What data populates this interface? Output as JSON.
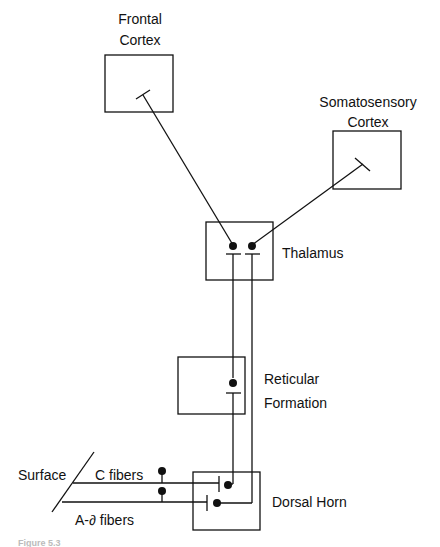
{
  "diagram": {
    "colors": {
      "ink": "#111111",
      "background": "#ffffff"
    },
    "nodes": [
      {
        "id": "frontal",
        "label_lines": [
          "Frontal",
          "Cortex"
        ]
      },
      {
        "id": "somato",
        "label_lines": [
          "Somatosensory",
          "Cortex"
        ]
      },
      {
        "id": "thalamus",
        "label": "Thalamus"
      },
      {
        "id": "reticular",
        "label_lines": [
          "Reticular",
          "Formation"
        ]
      },
      {
        "id": "dorsal",
        "label": "Dorsal Horn"
      }
    ],
    "inputs": {
      "surface": "Surface",
      "c_fibers": "C fibers",
      "a_delta_fibers": "A-∂ fibers"
    },
    "edges": [
      {
        "from": "c_fibers",
        "to": "dorsal",
        "type": "synapse"
      },
      {
        "from": "a_delta_fibers",
        "to": "dorsal",
        "type": "synapse"
      },
      {
        "from": "dorsal",
        "to": "reticular",
        "type": "synapse"
      },
      {
        "from": "reticular",
        "to": "thalamus",
        "type": "synapse"
      },
      {
        "from": "dorsal",
        "to": "thalamus",
        "type": "synapse"
      },
      {
        "from": "thalamus",
        "to": "frontal",
        "type": "synapse"
      },
      {
        "from": "thalamus",
        "to": "somato",
        "type": "synapse"
      }
    ],
    "caption": "Figure 5.3"
  }
}
